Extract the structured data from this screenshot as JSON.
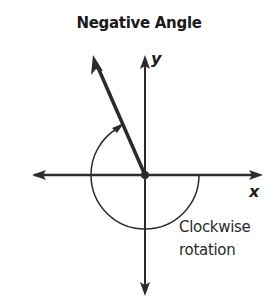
{
  "title": "Negative Angle",
  "axes": {
    "x_label": "x",
    "y_label": "y"
  },
  "annotation": {
    "line1": "Clockwise",
    "line2": "rotation"
  },
  "colors": {
    "stroke": "#2b2b2b",
    "background": "#ffffff"
  }
}
